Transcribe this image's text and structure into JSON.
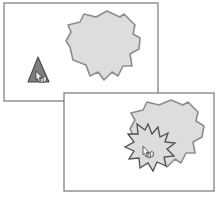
{
  "figure": {
    "title": "Two-panel interaction diagram",
    "caption": "Upper panel: pointer on dark triangle beside a gray blob. Lower panel: pointer triggers a burst where it meets the gray blob.",
    "canvas": {
      "width": 222,
      "height": 199,
      "background": "#ffffff"
    }
  },
  "colors": {
    "panel_border": "#6b6b6b",
    "panel_fill": "#ffffff",
    "blob_fill": "#dddddd",
    "blob_stroke": "#8d8d8d",
    "triangle_fill": "#7d7d7d",
    "triangle_stroke": "#4a4a4a",
    "burst_fill": "#dcdcdc",
    "burst_stroke": "#4f4f4f",
    "cursor_fill": "#f2f2f2",
    "cursor_stroke": "#3a3a3a"
  },
  "panels": [
    {
      "id": "upper-panel",
      "name": "Upper panel",
      "order": "1",
      "x": 4,
      "y": 3,
      "width": 154,
      "height": 98,
      "contents": [
        "triangle-shape",
        "blob-shape",
        "hand-cursor"
      ]
    },
    {
      "id": "lower-panel",
      "name": "Lower panel",
      "order": "2",
      "x": 64,
      "y": 93,
      "width": 150,
      "height": 98,
      "contents": [
        "blob-shape",
        "burst-shape",
        "hand-cursor"
      ]
    }
  ],
  "shapes": {
    "blob_upper": {
      "label": "Gray irregular blob",
      "points": "107,11 120,17 124,14 135,25 133,34 140,38 139,49 130,54 132,66 123,66 118,76 112,72 104,80 98,72 90,76 86,65 73,60 70,47 66,41 71,32 68,25 80,22 84,14 96,17"
    },
    "blob_lower": {
      "label": "Gray irregular blob",
      "points": "171,100 183,105 188,102 198,112 196,121 204,126 202,137 193,142 195,153 186,153 181,163 175,159 167,167 160,159 152,163 148,152 136,147 133,135 130,129 135,120 131,113 143,110 147,102 159,105"
    },
    "triangle": {
      "label": "Dark triangle marker",
      "points": "38,57 49,82 28,82"
    },
    "burst": {
      "label": "Collision burst",
      "points": "148,124 152,134 158,127 160,137 168,133 165,142 175,143 167,149 174,156 164,157 166,166 157,162 153,171 148,163 140,168 139,158 129,159 134,151 125,147 134,142 128,134 138,134 137,124 145,130"
    }
  },
  "cursors": [
    {
      "id": "cursor-upper",
      "label": "Hand pointer on triangle",
      "x": 36,
      "y": 71
    },
    {
      "id": "cursor-lower",
      "label": "Hand pointer at burst",
      "x": 150,
      "y": 152
    }
  ]
}
